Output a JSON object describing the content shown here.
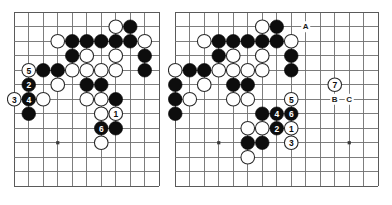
{
  "figure": {
    "kind": "go-diagram-pair",
    "background_color": "#ffffff",
    "grid_color": "#6f6f6f",
    "black_color": "#0d0d0d",
    "white_color": "#ffffff",
    "label_color": "#1a1a1a"
  },
  "boards": [
    {
      "id": "left",
      "name": "left-go-board",
      "x": 14,
      "y": 12,
      "cols": 11,
      "rows": 13,
      "cell": 14.5,
      "star_points": [
        {
          "col": 3,
          "row": 9
        }
      ],
      "stones": [
        {
          "color": "white",
          "col": 7,
          "row": 1,
          "label": ""
        },
        {
          "color": "black",
          "col": 8,
          "row": 1,
          "label": ""
        },
        {
          "color": "white",
          "col": 3,
          "row": 2,
          "label": ""
        },
        {
          "color": "black",
          "col": 4,
          "row": 2,
          "label": ""
        },
        {
          "color": "black",
          "col": 5,
          "row": 2,
          "label": ""
        },
        {
          "color": "black",
          "col": 6,
          "row": 2,
          "label": ""
        },
        {
          "color": "black",
          "col": 7,
          "row": 2,
          "label": ""
        },
        {
          "color": "black",
          "col": 8,
          "row": 2,
          "label": ""
        },
        {
          "color": "white",
          "col": 9,
          "row": 2,
          "label": ""
        },
        {
          "color": "black",
          "col": 4,
          "row": 3,
          "label": ""
        },
        {
          "color": "white",
          "col": 5,
          "row": 3,
          "label": ""
        },
        {
          "color": "white",
          "col": 7,
          "row": 3,
          "label": ""
        },
        {
          "color": "black",
          "col": 9,
          "row": 3,
          "label": ""
        },
        {
          "color": "white",
          "col": 1,
          "row": 4,
          "label": "5"
        },
        {
          "color": "black",
          "col": 2,
          "row": 4,
          "label": ""
        },
        {
          "color": "black",
          "col": 3,
          "row": 4,
          "label": ""
        },
        {
          "color": "white",
          "col": 4,
          "row": 4,
          "label": ""
        },
        {
          "color": "white",
          "col": 5,
          "row": 4,
          "label": ""
        },
        {
          "color": "white",
          "col": 6,
          "row": 4,
          "label": ""
        },
        {
          "color": "white",
          "col": 7,
          "row": 4,
          "label": ""
        },
        {
          "color": "black",
          "col": 9,
          "row": 4,
          "label": ""
        },
        {
          "color": "black",
          "col": 1,
          "row": 5,
          "label": "2"
        },
        {
          "color": "white",
          "col": 3,
          "row": 5,
          "label": ""
        },
        {
          "color": "black",
          "col": 5,
          "row": 5,
          "label": ""
        },
        {
          "color": "black",
          "col": 6,
          "row": 5,
          "label": ""
        },
        {
          "color": "white",
          "col": 0,
          "row": 6,
          "label": "3"
        },
        {
          "color": "black",
          "col": 1,
          "row": 6,
          "label": "4"
        },
        {
          "color": "white",
          "col": 2,
          "row": 6,
          "label": ""
        },
        {
          "color": "white",
          "col": 5,
          "row": 6,
          "label": ""
        },
        {
          "color": "white",
          "col": 6,
          "row": 6,
          "label": ""
        },
        {
          "color": "black",
          "col": 7,
          "row": 6,
          "label": ""
        },
        {
          "color": "black",
          "col": 1,
          "row": 7,
          "label": ""
        },
        {
          "color": "white",
          "col": 6,
          "row": 7,
          "label": ""
        },
        {
          "color": "white",
          "col": 7,
          "row": 7,
          "label": "1"
        },
        {
          "color": "black",
          "col": 6,
          "row": 8,
          "label": "6"
        },
        {
          "color": "black",
          "col": 7,
          "row": 8,
          "label": ""
        },
        {
          "color": "white",
          "col": 6,
          "row": 9,
          "label": ""
        }
      ],
      "point_labels": []
    },
    {
      "id": "right",
      "name": "right-go-board",
      "x": 175,
      "y": 12,
      "cols": 15,
      "rows": 13,
      "cell": 14.5,
      "star_points": [
        {
          "col": 3,
          "row": 9
        },
        {
          "col": 12,
          "row": 9
        }
      ],
      "stones": [
        {
          "color": "white",
          "col": 6,
          "row": 1,
          "label": ""
        },
        {
          "color": "black",
          "col": 7,
          "row": 1,
          "label": ""
        },
        {
          "color": "white",
          "col": 2,
          "row": 2,
          "label": ""
        },
        {
          "color": "black",
          "col": 3,
          "row": 2,
          "label": ""
        },
        {
          "color": "black",
          "col": 4,
          "row": 2,
          "label": ""
        },
        {
          "color": "black",
          "col": 5,
          "row": 2,
          "label": ""
        },
        {
          "color": "black",
          "col": 6,
          "row": 2,
          "label": ""
        },
        {
          "color": "black",
          "col": 7,
          "row": 2,
          "label": ""
        },
        {
          "color": "white",
          "col": 8,
          "row": 2,
          "label": ""
        },
        {
          "color": "black",
          "col": 3,
          "row": 3,
          "label": ""
        },
        {
          "color": "white",
          "col": 4,
          "row": 3,
          "label": ""
        },
        {
          "color": "white",
          "col": 6,
          "row": 3,
          "label": ""
        },
        {
          "color": "black",
          "col": 8,
          "row": 3,
          "label": ""
        },
        {
          "color": "white",
          "col": 0,
          "row": 4,
          "label": ""
        },
        {
          "color": "black",
          "col": 1,
          "row": 4,
          "label": ""
        },
        {
          "color": "black",
          "col": 2,
          "row": 4,
          "label": ""
        },
        {
          "color": "white",
          "col": 3,
          "row": 4,
          "label": ""
        },
        {
          "color": "white",
          "col": 4,
          "row": 4,
          "label": ""
        },
        {
          "color": "white",
          "col": 5,
          "row": 4,
          "label": ""
        },
        {
          "color": "white",
          "col": 6,
          "row": 4,
          "label": ""
        },
        {
          "color": "black",
          "col": 8,
          "row": 4,
          "label": ""
        },
        {
          "color": "white",
          "col": 11,
          "row": 5,
          "label": "7"
        },
        {
          "color": "black",
          "col": 0,
          "row": 5,
          "label": ""
        },
        {
          "color": "white",
          "col": 2,
          "row": 5,
          "label": ""
        },
        {
          "color": "black",
          "col": 4,
          "row": 5,
          "label": ""
        },
        {
          "color": "black",
          "col": 5,
          "row": 5,
          "label": ""
        },
        {
          "color": "white",
          "col": 8,
          "row": 6,
          "label": "5"
        },
        {
          "color": "black",
          "col": 0,
          "row": 6,
          "label": ""
        },
        {
          "color": "white",
          "col": 1,
          "row": 6,
          "label": ""
        },
        {
          "color": "white",
          "col": 4,
          "row": 6,
          "label": ""
        },
        {
          "color": "white",
          "col": 5,
          "row": 6,
          "label": ""
        },
        {
          "color": "black",
          "col": 6,
          "row": 7,
          "label": ""
        },
        {
          "color": "black",
          "col": 7,
          "row": 7,
          "label": "4"
        },
        {
          "color": "black",
          "col": 8,
          "row": 7,
          "label": "6"
        },
        {
          "color": "black",
          "col": 0,
          "row": 7,
          "label": ""
        },
        {
          "color": "white",
          "col": 5,
          "row": 8,
          "label": ""
        },
        {
          "color": "white",
          "col": 6,
          "row": 8,
          "label": ""
        },
        {
          "color": "black",
          "col": 7,
          "row": 8,
          "label": "2"
        },
        {
          "color": "white",
          "col": 8,
          "row": 8,
          "label": "1"
        },
        {
          "color": "black",
          "col": 5,
          "row": 9,
          "label": ""
        },
        {
          "color": "black",
          "col": 6,
          "row": 9,
          "label": ""
        },
        {
          "color": "white",
          "col": 8,
          "row": 9,
          "label": "3"
        },
        {
          "color": "white",
          "col": 5,
          "row": 10,
          "label": ""
        }
      ],
      "point_labels": [
        {
          "text": "A",
          "col": 9,
          "row": 1
        },
        {
          "text": "B",
          "col": 11,
          "row": 6
        },
        {
          "text": "C",
          "col": 12,
          "row": 6
        }
      ]
    }
  ]
}
